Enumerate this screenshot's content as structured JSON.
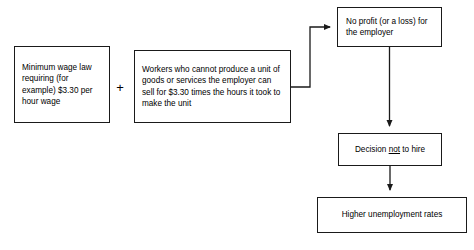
{
  "diagram": {
    "operator": "+",
    "line_color": "#1a1a1a",
    "box_fill": "#ffffff",
    "background": "#ffffff",
    "nodes": {
      "min_wage": "Minimum wage law requiring (for example) $3.30 per hour wage",
      "workers": "Workers who cannot produce a unit of goods or services the employer can sell for $3.30 times the hours it took to make the unit",
      "no_profit": "No profit (or a loss) for the employer",
      "decision_prefix": "Decision ",
      "decision_emphasis": "not",
      "decision_suffix": " to hire",
      "decision_full": "Decision not to hire",
      "unemployment": "Higher unemployment rates"
    },
    "edges": [
      {
        "id": "workers-to-no-profit",
        "from": "workers",
        "to": "no_profit",
        "style": "elbow",
        "arrowhead": "right"
      },
      {
        "id": "no-profit-to-decision",
        "from": "no_profit",
        "to": "decision",
        "style": "vertical",
        "arrowhead": "down"
      },
      {
        "id": "decision-to-unemployment",
        "from": "decision",
        "to": "unemployment",
        "style": "vertical",
        "arrowhead": "down"
      }
    ]
  }
}
